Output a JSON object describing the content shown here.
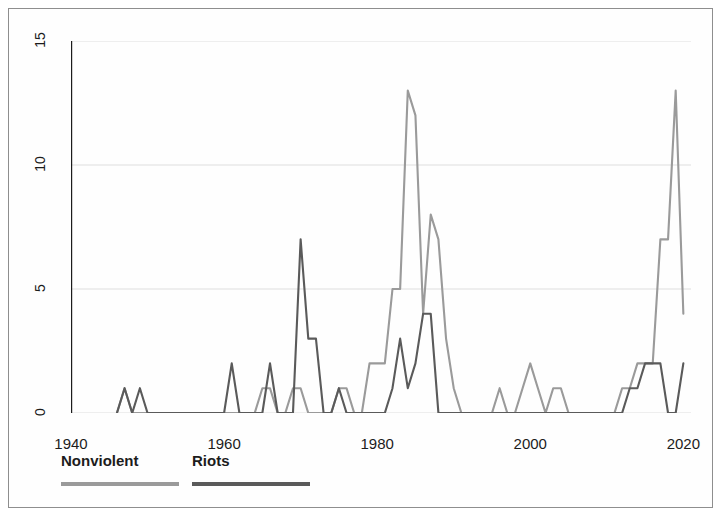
{
  "chart_data": {
    "type": "line",
    "title": "",
    "subtitle": "",
    "xlabel": "",
    "ylabel": "",
    "xlim": [
      1940,
      2021
    ],
    "ylim": [
      0,
      15
    ],
    "grid": true,
    "grid_axis": "y",
    "legend_position": "below-left",
    "x_ticks": [
      1940,
      1960,
      1980,
      2000,
      2020
    ],
    "x_tick_labels": [
      "1940",
      "1960",
      "1980",
      "2000",
      "2020"
    ],
    "y_ticks": [
      0,
      5,
      10,
      15
    ],
    "y_tick_labels": [
      "0",
      "5",
      "10",
      "15"
    ],
    "x": [
      1946,
      1947,
      1948,
      1949,
      1950,
      1951,
      1952,
      1953,
      1954,
      1955,
      1956,
      1957,
      1958,
      1959,
      1960,
      1961,
      1962,
      1963,
      1964,
      1965,
      1966,
      1967,
      1968,
      1969,
      1970,
      1971,
      1972,
      1973,
      1974,
      1975,
      1976,
      1977,
      1978,
      1979,
      1980,
      1981,
      1982,
      1983,
      1984,
      1985,
      1986,
      1987,
      1988,
      1989,
      1990,
      1991,
      1992,
      1993,
      1994,
      1995,
      1996,
      1997,
      1998,
      1999,
      2000,
      2001,
      2002,
      2003,
      2004,
      2005,
      2006,
      2007,
      2008,
      2009,
      2010,
      2011,
      2012,
      2013,
      2014,
      2015,
      2016,
      2017,
      2018,
      2019,
      2020
    ],
    "series": [
      {
        "name": "Nonviolent",
        "color": "#9a9a9a",
        "values": [
          0,
          1,
          0,
          0,
          0,
          0,
          0,
          0,
          0,
          0,
          0,
          0,
          0,
          0,
          0,
          0,
          0,
          0,
          0,
          1,
          1,
          0,
          0,
          1,
          1,
          0,
          0,
          0,
          0,
          1,
          1,
          0,
          0,
          2,
          2,
          2,
          5,
          5,
          13,
          12,
          4,
          8,
          7,
          3,
          1,
          0,
          0,
          0,
          0,
          0,
          1,
          0,
          0,
          1,
          2,
          1,
          0,
          1,
          1,
          0,
          0,
          0,
          0,
          0,
          0,
          0,
          1,
          1,
          2,
          2,
          2,
          7,
          7,
          13,
          4
        ]
      },
      {
        "name": "Riots",
        "color": "#5a5a5a",
        "values": [
          0,
          1,
          0,
          1,
          0,
          0,
          0,
          0,
          0,
          0,
          0,
          0,
          0,
          0,
          0,
          2,
          0,
          0,
          0,
          0,
          2,
          0,
          0,
          0,
          7,
          3,
          3,
          0,
          0,
          1,
          0,
          0,
          0,
          0,
          0,
          0,
          1,
          3,
          1,
          2,
          4,
          4,
          0,
          0,
          0,
          0,
          0,
          0,
          0,
          0,
          0,
          0,
          0,
          0,
          0,
          0,
          0,
          0,
          0,
          0,
          0,
          0,
          0,
          0,
          0,
          0,
          0,
          1,
          1,
          2,
          2,
          2,
          0,
          0,
          2
        ]
      }
    ]
  },
  "legend": {
    "entries": [
      {
        "label": "Nonviolent",
        "color": "#9a9a9a"
      },
      {
        "label": "Riots",
        "color": "#5a5a5a"
      }
    ]
  },
  "axes": {
    "y_label_0": "0",
    "y_label_5": "5",
    "y_label_10": "10",
    "y_label_15": "15",
    "x_label_1940": "1940",
    "x_label_1960": "1960",
    "x_label_1980": "1980",
    "x_label_2000": "2000",
    "x_label_2020": "2020"
  },
  "style": {
    "axis_color": "#1c1c1c",
    "grid_color": "#dedede",
    "frame_color": "#8e8e8e",
    "background": "#fefefe"
  }
}
